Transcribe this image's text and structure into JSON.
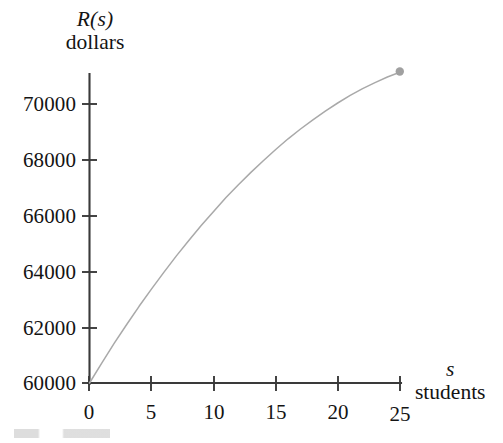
{
  "figure": {
    "background_color": "#ffffff",
    "axis_color": "#3a3a3a",
    "text_color": "#141414"
  },
  "y_axis": {
    "title_symbol": "R(s)",
    "title_unit": "dollars",
    "tick_labels": [
      "70000",
      "68000",
      "66000",
      "64000",
      "62000",
      "60000"
    ],
    "tick_values": [
      70000,
      68000,
      66000,
      64000,
      62000,
      60000
    ]
  },
  "x_axis": {
    "title_symbol": "s",
    "title_unit": "students",
    "tick_labels": [
      "0",
      "5",
      "10",
      "15",
      "20",
      "25"
    ],
    "tick_values": [
      0,
      5,
      10,
      15,
      20,
      25
    ]
  },
  "curve": {
    "color": "#a9a9a9",
    "endpoint_color": "#a0a0a0",
    "endpoint_label": ""
  },
  "chart_data": {
    "type": "line",
    "title": "",
    "subtitle": "",
    "xlabel": "s students",
    "ylabel": "R(s) dollars",
    "xlim": [
      0,
      26.5
    ],
    "ylim": [
      60000,
      71600
    ],
    "grid": false,
    "legend": null,
    "x_ticks": [
      0,
      5,
      10,
      15,
      20,
      25
    ],
    "x_tick_labels": [
      "0",
      "5",
      "10",
      "15",
      "20",
      "25"
    ],
    "y_ticks": [
      60000,
      62000,
      64000,
      66000,
      68000,
      70000
    ],
    "y_tick_labels": [
      "60000",
      "62000",
      "64000",
      "66000",
      "68000",
      "70000"
    ],
    "series": [
      {
        "name": "R(s)",
        "color": "#a9a9a9",
        "x": [
          0,
          1,
          2,
          3,
          4,
          5,
          6,
          7,
          8,
          9,
          10,
          11,
          12,
          13,
          14,
          15,
          16,
          17,
          18,
          19,
          20,
          21,
          22,
          23,
          24,
          25
        ],
        "values": [
          60000,
          60720,
          61420,
          62090,
          62740,
          63360,
          63960,
          64540,
          65090,
          65620,
          66130,
          66620,
          67080,
          67520,
          67940,
          68340,
          68720,
          69070,
          69400,
          69710,
          70000,
          70270,
          70510,
          70730,
          70930,
          71100
        ],
        "marker_points": [
          {
            "x": 25,
            "y": 71100,
            "style": "filled-circle",
            "color": "#a0a0a0"
          }
        ],
        "annotations": []
      }
    ]
  }
}
